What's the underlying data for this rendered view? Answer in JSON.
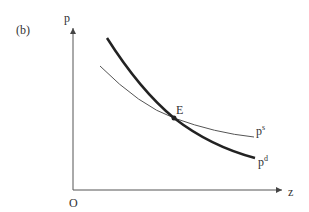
{
  "panel_label": "(b)",
  "axes": {
    "y_label": "p",
    "x_label": "z",
    "origin_label": "O"
  },
  "curves": [
    {
      "id": "demand",
      "label_base": "p",
      "label_sup": "d",
      "style": "thick",
      "color": "#222222"
    },
    {
      "id": "supply",
      "label_base": "p",
      "label_sup": "s",
      "style": "thin",
      "color": "#555555"
    }
  ],
  "equilibrium": {
    "label": "E"
  },
  "colors": {
    "axis": "#555555",
    "text": "#333333"
  }
}
